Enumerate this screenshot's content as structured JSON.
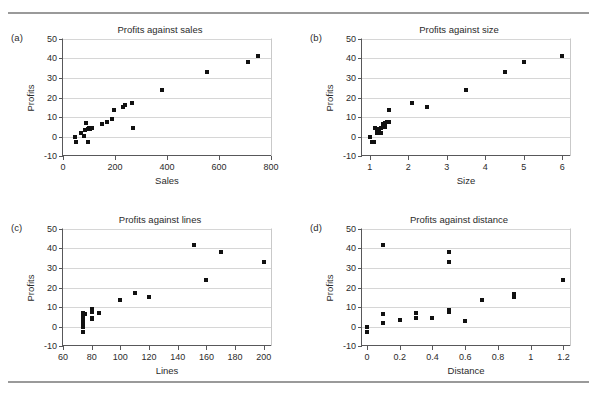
{
  "figure": {
    "rule_color": "#9a9a9a",
    "point_color": "#111111",
    "grid_color": "#d6d6d6",
    "axis_color": "#58585a"
  },
  "panels": [
    {
      "letter": "(a)",
      "title": "Profits against sales",
      "xlabel": "Sales",
      "ylabel": "Profits"
    },
    {
      "letter": "(b)",
      "title": "Profits against size",
      "xlabel": "Size",
      "ylabel": "Profits"
    },
    {
      "letter": "(c)",
      "title": "Profits against lines",
      "xlabel": "Lines",
      "ylabel": "Profits"
    },
    {
      "letter": "(d)",
      "title": "Profits against distance",
      "xlabel": "Distance",
      "ylabel": "Profits"
    }
  ],
  "chart_data": [
    {
      "type": "scatter",
      "panel": "(a)",
      "title": "Profits against sales",
      "xlabel": "Sales",
      "ylabel": "Profits",
      "xlim": [
        0,
        800
      ],
      "ylim": [
        -10,
        50
      ],
      "xticks": [
        0,
        200,
        400,
        600,
        800
      ],
      "yticks": [
        -10,
        0,
        10,
        20,
        30,
        40,
        50
      ],
      "xtick_labels": [
        "0",
        "200",
        "400",
        "600",
        "800"
      ],
      "ytick_labels": [
        "-10",
        "0",
        "10",
        "20",
        "30",
        "40",
        "50"
      ],
      "grid": "horizontal",
      "legend": null,
      "x": [
        45,
        50,
        70,
        80,
        85,
        90,
        95,
        98,
        100,
        105,
        110,
        150,
        170,
        190,
        195,
        230,
        240,
        265,
        270,
        380,
        555,
        710,
        750
      ],
      "y": [
        -0.5,
        -3.0,
        2.0,
        0.5,
        3.5,
        7.0,
        -3.0,
        4.0,
        4.5,
        4.0,
        4.3,
        6.5,
        7.5,
        8.8,
        13.5,
        15.2,
        16.0,
        17.0,
        4.2,
        24.0,
        33.0,
        38.0,
        41.5
      ]
    },
    {
      "type": "scatter",
      "panel": "(b)",
      "title": "Profits against size",
      "xlabel": "Size",
      "ylabel": "Profits",
      "xlim": [
        0.8,
        6.2
      ],
      "ylim": [
        -10,
        50
      ],
      "xticks": [
        1,
        2,
        3,
        4,
        5,
        6
      ],
      "yticks": [
        -10,
        0,
        10,
        20,
        30,
        40,
        50
      ],
      "xtick_labels": [
        "1",
        "2",
        "3",
        "4",
        "5",
        "6"
      ],
      "ytick_labels": [
        "-10",
        "0",
        "10",
        "20",
        "30",
        "40",
        "50"
      ],
      "grid": "horizontal",
      "legend": null,
      "x": [
        1.0,
        1.05,
        1.1,
        1.15,
        1.2,
        1.2,
        1.25,
        1.3,
        1.3,
        1.35,
        1.4,
        1.4,
        1.45,
        1.5,
        1.5,
        2.1,
        2.5,
        3.5,
        4.5,
        5.0,
        6.0
      ],
      "y": [
        -0.5,
        -3.0,
        -3.0,
        4.3,
        2.0,
        4.0,
        3.5,
        1.8,
        4.5,
        6.5,
        5.0,
        7.0,
        7.5,
        7.2,
        13.5,
        17.0,
        15.2,
        24.0,
        33.0,
        38.0,
        41.5
      ]
    },
    {
      "type": "scatter",
      "panel": "(c)",
      "title": "Profits against lines",
      "xlabel": "Lines",
      "ylabel": "Profits",
      "xlim": [
        60,
        205
      ],
      "ylim": [
        -10,
        50
      ],
      "xticks": [
        60,
        80,
        100,
        120,
        140,
        160,
        180,
        200
      ],
      "yticks": [
        -10,
        0,
        10,
        20,
        30,
        40,
        50
      ],
      "xtick_labels": [
        "60",
        "80",
        "100",
        "120",
        "140",
        "160",
        "180",
        "200"
      ],
      "ytick_labels": [
        "-10",
        "0",
        "10",
        "20",
        "30",
        "40",
        "50"
      ],
      "grid": "horizontal",
      "legend": null,
      "x": [
        74,
        74,
        74,
        74,
        74,
        74,
        74,
        75,
        80,
        80,
        80,
        80,
        85,
        100,
        110,
        120,
        151,
        160,
        170,
        200
      ],
      "y": [
        -3.0,
        -0.5,
        1.8,
        3.0,
        4.3,
        5.0,
        7.0,
        6.5,
        4.0,
        4.5,
        7.5,
        8.8,
        6.8,
        13.5,
        17.0,
        15.2,
        42.0,
        23.8,
        38.0,
        33.0
      ]
    },
    {
      "type": "scatter",
      "panel": "(d)",
      "title": "Profits against distance",
      "xlabel": "Distance",
      "ylabel": "Profits",
      "xlim": [
        -0.03,
        1.24
      ],
      "ylim": [
        -10,
        50
      ],
      "xticks": [
        0,
        0.2,
        0.4,
        0.6,
        0.8,
        1.0,
        1.2
      ],
      "yticks": [
        -10,
        0,
        10,
        20,
        30,
        40,
        50
      ],
      "xtick_labels": [
        "0",
        "0.2",
        "0.4",
        "0.6",
        "0.8",
        "1",
        "1.2"
      ],
      "ytick_labels": [
        "-10",
        "0",
        "10",
        "20",
        "30",
        "40",
        "50"
      ],
      "grid": "horizontal",
      "legend": null,
      "x": [
        0.0,
        0.0,
        0.1,
        0.1,
        0.1,
        0.2,
        0.3,
        0.3,
        0.4,
        0.5,
        0.5,
        0.5,
        0.5,
        0.6,
        0.7,
        0.9,
        0.9,
        1.2
      ],
      "y": [
        -0.5,
        -3.0,
        42.0,
        6.2,
        2.0,
        3.5,
        7.0,
        4.3,
        4.5,
        38.0,
        33.0,
        8.5,
        7.2,
        3.0,
        13.5,
        16.5,
        15.2,
        23.8
      ]
    }
  ]
}
